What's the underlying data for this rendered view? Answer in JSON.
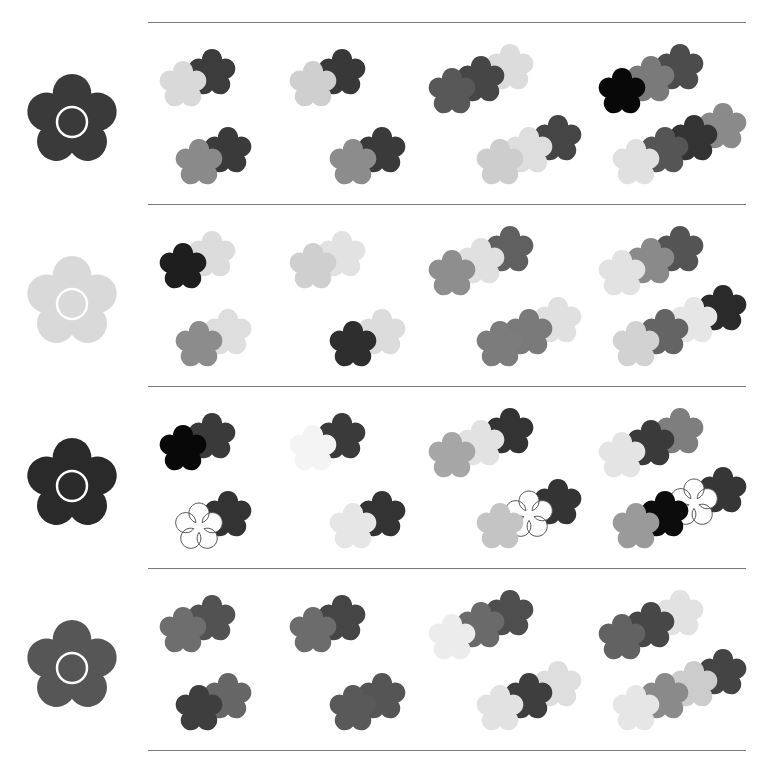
{
  "puzzle": {
    "type": "flower-matching-worksheet",
    "instruction_visible": false,
    "rows": [
      {
        "reference": {
          "color": "#3a3a3a",
          "center_ring": "#ffffff"
        },
        "groups": [
          {
            "flowers": [
              "#d9d9d9",
              "#3c3c3c"
            ]
          },
          {
            "flowers": [
              "#8a8a8a",
              "#3a3a3a"
            ]
          },
          {
            "flowers": [
              "#cfcfcf",
              "#383838"
            ]
          },
          {
            "flowers": [
              "#8c8c8c",
              "#3a3a3a"
            ]
          },
          {
            "flowers": [
              "#585858",
              "#464646",
              "#dcdcdc"
            ]
          },
          {
            "flowers": [
              "#cdcdcd",
              "#dedede",
              "#454545"
            ]
          },
          {
            "flowers": [
              "#080808",
              "#7a7a7a",
              "#4c4c4c"
            ]
          },
          {
            "flowers": [
              "#e0e0e0",
              "#555555",
              "#333333",
              "#8a8a8a"
            ]
          }
        ]
      },
      {
        "reference": {
          "color": "#d9d9d9",
          "center_ring": "#ffffff"
        },
        "groups": [
          {
            "flowers": [
              "#1e1e1e",
              "#dcdcdc"
            ]
          },
          {
            "flowers": [
              "#8c8c8c",
              "#dedede"
            ]
          },
          {
            "flowers": [
              "#cfcfcf",
              "#e2e2e2"
            ]
          },
          {
            "flowers": [
              "#2e2e2e",
              "#dcdcdc"
            ]
          },
          {
            "flowers": [
              "#8e8e8e",
              "#e0e0e0",
              "#606060"
            ]
          },
          {
            "flowers": [
              "#7c7c7c",
              "#7a7a7a",
              "#e0e0e0"
            ]
          },
          {
            "flowers": [
              "#e2e2e2",
              "#8a8a8a",
              "#545454"
            ]
          },
          {
            "flowers": [
              "#d2d2d2",
              "#646464",
              "#e6e6e6",
              "#2a2a2a"
            ]
          }
        ]
      },
      {
        "reference": {
          "color": "#2a2a2a",
          "center_ring": "#ffffff"
        },
        "groups": [
          {
            "flowers": [
              "#080808",
              "#3a3a3a"
            ]
          },
          {
            "flowers": [
              "#ffffff",
              "#333333"
            ],
            "outlined": [
              true,
              false
            ]
          },
          {
            "flowers": [
              "#f4f4f4",
              "#3a3a3a"
            ]
          },
          {
            "flowers": [
              "#e6e6e6",
              "#333333"
            ]
          },
          {
            "flowers": [
              "#a6a6a6",
              "#e2e2e2",
              "#333333"
            ]
          },
          {
            "flowers": [
              "#c4c4c4",
              "#ffffff",
              "#343434"
            ],
            "outlined": [
              false,
              true,
              false
            ]
          },
          {
            "flowers": [
              "#e4e4e4",
              "#3a3a3a",
              "#7e7e7e"
            ]
          },
          {
            "flowers": [
              "#9a9a9a",
              "#0c0c0c",
              "#ffffff",
              "#363636"
            ],
            "outlined": [
              false,
              false,
              true,
              false
            ]
          }
        ]
      },
      {
        "reference": {
          "color": "#565656",
          "center_ring": "#ffffff"
        },
        "groups": [
          {
            "flowers": [
              "#6e6e6e",
              "#525252"
            ]
          },
          {
            "flowers": [
              "#3e3e3e",
              "#666666"
            ]
          },
          {
            "flowers": [
              "#6c6c6c",
              "#454545"
            ]
          },
          {
            "flowers": [
              "#595959",
              "#555555"
            ]
          },
          {
            "flowers": [
              "#ececec",
              "#6a6a6a",
              "#4e4e4e"
            ]
          },
          {
            "flowers": [
              "#e2e2e2",
              "#3e3e3e",
              "#dedede"
            ]
          },
          {
            "flowers": [
              "#626262",
              "#474747",
              "#e2e2e2"
            ]
          },
          {
            "flowers": [
              "#e6e6e6",
              "#8a8a8a",
              "#cccccc",
              "#444444"
            ]
          }
        ]
      }
    ]
  }
}
